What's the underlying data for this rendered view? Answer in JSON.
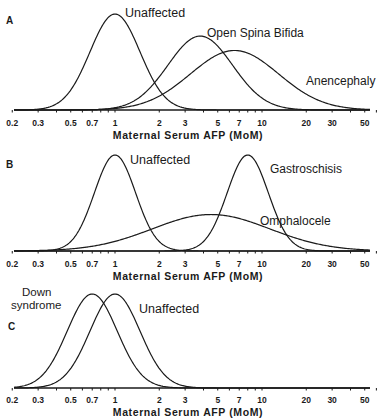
{
  "chart_data": [
    {
      "panel": "A",
      "type": "line",
      "xscale": "log",
      "xlabel": "Maternal Serum AFP (MoM)",
      "ylabel": "",
      "xlim": [
        0.2,
        60
      ],
      "xticks": [
        "0.2",
        "0.3",
        "0.5",
        "0.7",
        "1",
        "2",
        "3",
        "5",
        "7",
        "10",
        "20",
        "30",
        "50"
      ],
      "series": [
        {
          "name": "Unaffected",
          "median": 1.0,
          "log_sd": 0.17,
          "peak": 1.0
        },
        {
          "name": "Open Spina Bifida",
          "median": 3.8,
          "log_sd": 0.22,
          "peak": 0.77
        },
        {
          "name": "Anencephaly",
          "median": 6.5,
          "log_sd": 0.3,
          "peak": 0.62
        }
      ],
      "grid": false,
      "legend": "inline labels"
    },
    {
      "panel": "B",
      "type": "line",
      "xscale": "log",
      "xlabel": "Maternal Serum AFP (MoM)",
      "xlim": [
        0.2,
        60
      ],
      "xticks": [
        "0.2",
        "0.3",
        "0.5",
        "0.7",
        "1",
        "2",
        "3",
        "5",
        "7",
        "10",
        "20",
        "30",
        "50"
      ],
      "series": [
        {
          "name": "Unaffected",
          "median": 1.0,
          "log_sd": 0.14,
          "peak": 1.0
        },
        {
          "name": "Gastroschisis",
          "median": 8.0,
          "log_sd": 0.14,
          "peak": 1.0
        },
        {
          "name": "Omphalocele",
          "median": 4.5,
          "log_sd": 0.4,
          "peak": 0.38
        }
      ],
      "grid": false,
      "legend": "inline labels"
    },
    {
      "panel": "C",
      "type": "line",
      "xscale": "log",
      "xlabel": "Maternal Serum AFP (MoM)",
      "xlim": [
        0.2,
        60
      ],
      "xticks": [
        "0.2",
        "0.3",
        "0.5",
        "0.7",
        "1",
        "2",
        "3",
        "5",
        "7",
        "10",
        "20",
        "30",
        "50"
      ],
      "series": [
        {
          "name": "Down syndrome",
          "median": 0.7,
          "log_sd": 0.17,
          "peak": 1.0
        },
        {
          "name": "Unaffected",
          "median": 1.0,
          "log_sd": 0.17,
          "peak": 1.0
        }
      ],
      "grid": false,
      "legend": "inline labels"
    }
  ],
  "panels": {
    "a": {
      "letter": "A",
      "labels": [
        "Unaffected",
        "Open Spina Bifida",
        "Anencephaly"
      ]
    },
    "b": {
      "letter": "B",
      "labels": [
        "Unaffected",
        "Gastroschisis",
        "Omphalocele"
      ]
    },
    "c": {
      "letter": "C",
      "labels": [
        "Down",
        "syndrome",
        "Unaffected"
      ]
    }
  },
  "axis": {
    "xlabel": "Maternal Serum AFP (MoM)",
    "ticks": [
      "0.2",
      "0.3",
      "0.5",
      "0.7",
      "1",
      "2",
      "3",
      "5",
      "7",
      "10",
      "20",
      "30",
      "50"
    ]
  }
}
